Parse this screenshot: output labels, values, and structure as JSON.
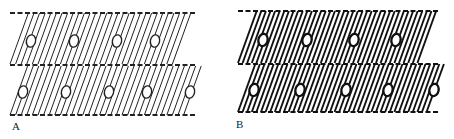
{
  "figure": {
    "panels": [
      {
        "id": "A",
        "label": "A",
        "label_pos": [
          12,
          122
        ],
        "stroke_width": 1.0,
        "hatch_spacing": 5.6,
        "color": "#222222",
        "bands": [
          {
            "name": "upper-band",
            "y_top": 13,
            "y_bottom": 64,
            "x_left": 10,
            "x_right": 195,
            "ovals_x": [
              31,
              74,
              117,
              155
            ],
            "oval_y": 41
          },
          {
            "name": "lower-band",
            "y_top": 66,
            "y_bottom": 115,
            "x_left": 10,
            "x_right": 206,
            "ovals_x": [
              23,
              66,
              109,
              147,
              190
            ],
            "oval_y": 92
          }
        ],
        "dashed_lines_y": [
          13,
          65,
          115
        ],
        "dashed_x_range": [
          10,
          196
        ]
      },
      {
        "id": "B",
        "label": "B",
        "label_pos": [
          236,
          120
        ],
        "stroke_width": 1.9,
        "hatch_spacing": 4.6,
        "color": "#111111",
        "bands": [
          {
            "name": "upper-band",
            "y_top": 11,
            "y_bottom": 63,
            "x_left": 238,
            "x_right": 438,
            "ovals_x": [
              263,
              307,
              354,
              396
            ],
            "oval_y": 40
          },
          {
            "name": "lower-band",
            "y_top": 64,
            "y_bottom": 112,
            "x_left": 238,
            "x_right": 448,
            "ovals_x": [
              254,
              300,
              346,
              388,
              434
            ],
            "oval_y": 90
          }
        ],
        "dashed_lines_y": [
          11,
          64,
          112
        ],
        "dashed_x_range": [
          238,
          440
        ]
      }
    ],
    "shear": 0.36
  }
}
